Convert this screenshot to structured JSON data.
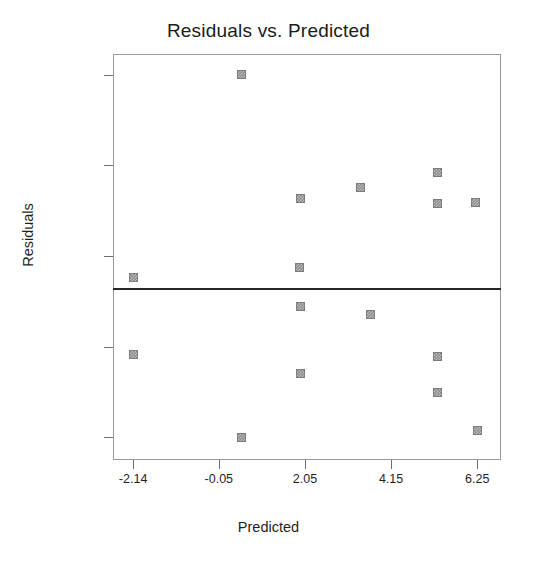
{
  "chart_data": {
    "type": "scatter",
    "title": "Residuals vs. Predicted",
    "xlabel": "Predicted",
    "ylabel": "Residuals",
    "grid": false,
    "legend": null,
    "xticks": [
      -2.14,
      -0.05,
      2.05,
      4.15,
      6.25
    ],
    "xtick_labels": [
      "-2.14",
      "-0.05",
      "2.05",
      "4.15",
      "6.25"
    ],
    "yticks": [
      1.5875,
      0.915,
      0.2425,
      -0.43,
      -1.1025
    ],
    "ytick_labels": [
      "1.5875",
      "0.915",
      "0.2425",
      "-0.43",
      "-1.1025"
    ],
    "xlim": [
      -2.63,
      6.83
    ],
    "ylim": [
      -1.27,
      1.74
    ],
    "reference_line": {
      "orientation": "horizontal",
      "y": 0.0,
      "color": "#262626"
    },
    "marker_color": "#8e8e8e",
    "points": [
      {
        "x": 0.5,
        "y": 1.5875
      },
      {
        "x": 5.28,
        "y": 0.86
      },
      {
        "x": 1.94,
        "y": 0.67
      },
      {
        "x": 3.4,
        "y": 0.75
      },
      {
        "x": 5.28,
        "y": 0.63
      },
      {
        "x": 6.21,
        "y": 0.64
      },
      {
        "x": 1.92,
        "y": 0.16
      },
      {
        "x": -2.14,
        "y": 0.08
      },
      {
        "x": 1.94,
        "y": -0.13
      },
      {
        "x": 3.65,
        "y": -0.19
      },
      {
        "x": -2.14,
        "y": -0.49
      },
      {
        "x": 5.28,
        "y": -0.5
      },
      {
        "x": 1.94,
        "y": -0.63
      },
      {
        "x": 5.28,
        "y": -0.77
      },
      {
        "x": 6.25,
        "y": -1.05
      },
      {
        "x": 0.5,
        "y": -1.1025
      }
    ]
  }
}
